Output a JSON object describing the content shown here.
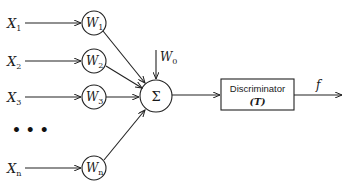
{
  "diagram": {
    "title": "",
    "inputs": [
      {
        "name": "X",
        "sub": "1",
        "weight": "W",
        "weight_sub": "1",
        "y": 23
      },
      {
        "name": "X",
        "sub": "2",
        "weight": "W",
        "weight_sub": "2",
        "y": 61
      },
      {
        "name": "X",
        "sub": "3",
        "weight": "W",
        "weight_sub": "3",
        "y": 97
      },
      {
        "name": "X",
        "sub": "n",
        "weight": "W",
        "weight_sub": "n",
        "y": 168
      }
    ],
    "ellipsis": "• • •",
    "bias": {
      "name": "W",
      "sub": "0"
    },
    "summation": {
      "symbol": "Σ"
    },
    "discriminator": {
      "label": "Discriminator",
      "param": "(T)"
    },
    "output": {
      "label": "f"
    }
  }
}
